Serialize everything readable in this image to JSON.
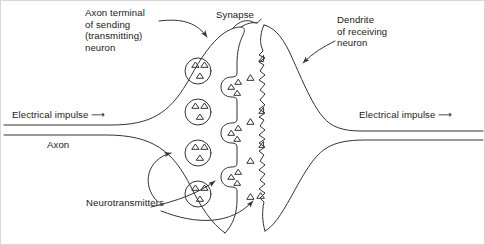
{
  "figure": {
    "background_color": "#ffffff",
    "stroke_color": "#333333",
    "border_color": "#d8d8d8",
    "width": 485,
    "height": 245
  },
  "labels": {
    "axon_terminal": "Axon terminal\nof sending\n(transmitting)\nneuron",
    "synapse": "Synapse",
    "dendrite": "Dendrite\nof receiving\nneuron",
    "electrical_impulse_left": "Electrical impulse ⟶",
    "electrical_impulse_right": "Electrical impulse ⟶",
    "axon": "Axon",
    "neurotransmitters": "Neurotransmitters"
  },
  "diagram_data": {
    "type": "diagram",
    "subject": "chemical synapse / neurotransmission",
    "structures": [
      {
        "name": "axon",
        "side": "presynaptic",
        "description": "two parallel lines entering from left edge"
      },
      {
        "name": "axon-terminal",
        "side": "presynaptic",
        "description": "bulbous terminal of sending neuron"
      },
      {
        "name": "synaptic-cleft",
        "side": "middle",
        "description": "gap between presynaptic and postsynaptic membranes"
      },
      {
        "name": "dendrite",
        "side": "postsynaptic",
        "description": "dendrite of receiving neuron extending to right edge"
      }
    ],
    "vesicles": [
      {
        "id": 1,
        "cx": 197,
        "cy": 70,
        "r": 13,
        "triangles": 3,
        "state": "free"
      },
      {
        "id": 2,
        "cx": 197,
        "cy": 111,
        "r": 13,
        "triangles": 3,
        "state": "free"
      },
      {
        "id": 3,
        "cx": 197,
        "cy": 152,
        "r": 13,
        "triangles": 3,
        "state": "free"
      },
      {
        "id": 4,
        "cx": 197,
        "cy": 193,
        "r": 13,
        "triangles": 3,
        "state": "free"
      }
    ],
    "docked_vesicles": [
      {
        "id": 5,
        "cx": 233,
        "cy": 85,
        "triangles": 3,
        "state": "docked-fusing"
      },
      {
        "id": 6,
        "cx": 233,
        "cy": 128,
        "triangles": 3,
        "state": "docked-fusing"
      },
      {
        "id": 7,
        "cx": 233,
        "cy": 172,
        "triangles": 3,
        "state": "docked-fusing"
      }
    ],
    "free_neurotransmitters_in_cleft": [
      {
        "x": 249,
        "y": 77
      },
      {
        "x": 249,
        "y": 121
      },
      {
        "x": 249,
        "y": 160
      },
      {
        "x": 249,
        "y": 196
      }
    ],
    "receptor_sites": [
      {
        "x": 266,
        "y": 58
      },
      {
        "x": 266,
        "y": 110
      },
      {
        "x": 266,
        "y": 143
      },
      {
        "x": 266,
        "y": 194
      }
    ],
    "leaders": [
      {
        "from": "axon_terminal",
        "to": "terminal-membrane-top",
        "arrow": true
      },
      {
        "from": "synapse",
        "to": "cleft-top",
        "arrow": false
      },
      {
        "from": "dendrite",
        "to": "dendrite-membrane",
        "arrow": true
      },
      {
        "from": "neurotransmitters",
        "to": "vesicle-3",
        "arrow": true
      },
      {
        "from": "neurotransmitters",
        "to": "docked-vesicle-7",
        "arrow": true
      },
      {
        "from": "neurotransmitters",
        "to": "receptor-site-4",
        "arrow": true
      }
    ]
  }
}
